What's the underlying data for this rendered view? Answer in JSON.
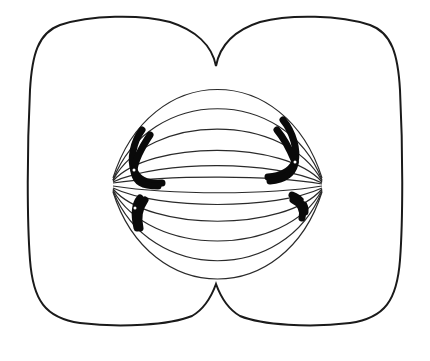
{
  "diagram": {
    "subject": "Cell division — late anaphase / early telophase",
    "alt": "Cell with cleavage furrows at top and bottom, spindle fibers between two poles, and chromosomes moving toward each pole",
    "colors": {
      "background": "#ffffff",
      "line": "#1a1a1a",
      "chromosome": "#0a0a0a"
    },
    "components": [
      {
        "id": "cell-membrane",
        "label": "Cell membrane with cleavage furrow"
      },
      {
        "id": "spindle",
        "label": "Spindle fibers"
      },
      {
        "id": "chromosomes-left",
        "label": "Chromosomes at left pole"
      },
      {
        "id": "chromosomes-right",
        "label": "Chromosomes at right pole"
      }
    ]
  }
}
